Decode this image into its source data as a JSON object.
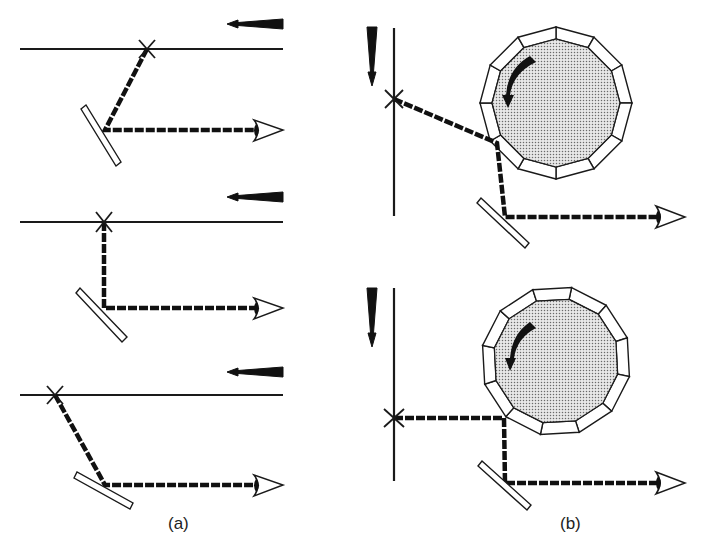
{
  "figure": {
    "panels": [
      {
        "id": "a",
        "label": "(a)",
        "description": "Oscillating plane mirror scanning a moving line; three successive positions",
        "subfigures": [
          {
            "name": "position-1",
            "line_motion": "leftward",
            "reflection": "angled-right"
          },
          {
            "name": "position-2",
            "line_motion": "leftward",
            "reflection": "perpendicular"
          },
          {
            "name": "position-3",
            "line_motion": "leftward",
            "reflection": "angled-left"
          }
        ]
      },
      {
        "id": "b",
        "label": "(b)",
        "description": "Rotating twelve-faceted polygon mirror scanning a moving line; two successive positions",
        "polygon_faces": 12,
        "rotation": "counter-clockwise",
        "subfigures": [
          {
            "name": "position-1",
            "line_motion": "downward",
            "reflection": "angled"
          },
          {
            "name": "position-2",
            "line_motion": "downward",
            "reflection": "perpendicular"
          }
        ]
      }
    ],
    "icons": {
      "observer": "eye-icon",
      "target_point": "x-mark-icon",
      "motion": "motion-arrow-icon",
      "rotation": "rotation-arrow-icon"
    },
    "colors": {
      "ink": "#111111",
      "background": "#ffffff",
      "polygon_fill": "#d8d8d8"
    }
  }
}
